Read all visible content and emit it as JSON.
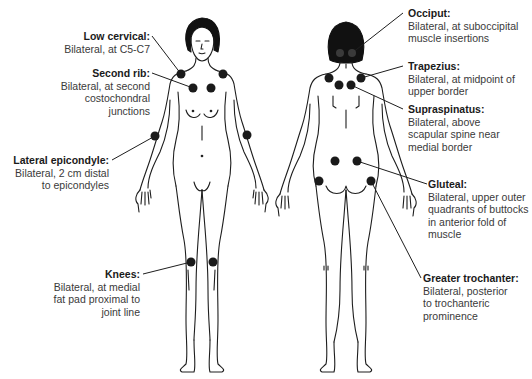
{
  "colors": {
    "outline": "#1e1e1e",
    "dot": "#1a1a1a",
    "hair": "#111111",
    "text_title": "#1a1a1a",
    "text_body": "#3a3a3a"
  },
  "figures": {
    "front": {
      "view": "anterior",
      "label": "front-figure"
    },
    "back": {
      "view": "posterior",
      "label": "back-figure"
    }
  },
  "labels": {
    "low_cervical": {
      "title": "Low cervical:",
      "desc": "Bilateral, at C5-C7"
    },
    "second_rib": {
      "title": "Second rib:",
      "desc": "Bilateral, at second\ncostochondral\njunctions"
    },
    "lateral_epicondyle": {
      "title": "Lateral epicondyle:",
      "desc": "Bilateral, 2 cm distal\nto epicondyles"
    },
    "knees": {
      "title": "Knees:",
      "desc": "Bilateral, at medial\nfat pad proximal to\njoint line"
    },
    "occiput": {
      "title": "Occiput:",
      "desc": "Bilateral, at suboccipital\nmuscle insertions"
    },
    "trapezius": {
      "title": "Trapezius:",
      "desc": "Bilateral, at midpoint of\nupper border"
    },
    "supraspinatus": {
      "title": "Supraspinatus:",
      "desc": "Bilateral, above\nscapular spine near\nmedial border"
    },
    "gluteal": {
      "title": "Gluteal:",
      "desc": "Bilateral, upper outer\nquadrants of buttocks\nin anterior fold of\nmuscle"
    },
    "greater_trochanter": {
      "title": "Greater trochanter:",
      "desc": "Bilateral, posterior\nto trochanteric\nprominence"
    }
  },
  "tender_points": [
    {
      "site": "low_cervical",
      "x": [
        181,
        223
      ],
      "y": 74
    },
    {
      "site": "second_rib",
      "x": [
        193,
        211
      ],
      "y": 88
    },
    {
      "site": "lateral_epicondyle",
      "x": [
        155,
        247
      ],
      "y": 136
    },
    {
      "site": "knees",
      "x": [
        191,
        213
      ],
      "y": 262
    },
    {
      "site": "occiput",
      "x": [
        340,
        352
      ],
      "y": 53
    },
    {
      "site": "trapezius",
      "x": [
        329,
        361
      ],
      "y": 78
    },
    {
      "site": "supraspinatus",
      "x": [
        339,
        351
      ],
      "y": 85
    },
    {
      "site": "gluteal",
      "x": [
        335,
        357
      ],
      "y": 161
    },
    {
      "site": "greater_trochanter",
      "x": [
        319,
        371
      ],
      "y": 181
    }
  ]
}
